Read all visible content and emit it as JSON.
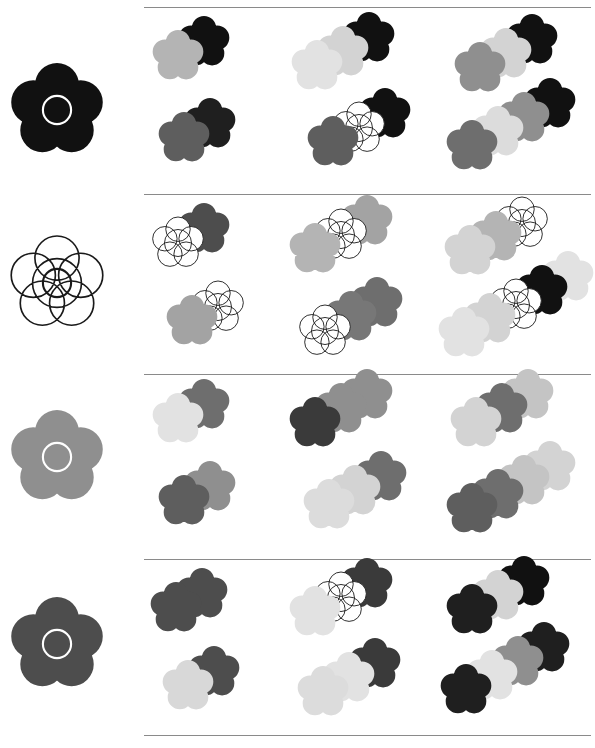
{
  "page": {
    "width": 595,
    "height": 748,
    "background": "#ffffff",
    "divider_color": "#8a8a8a",
    "divider_y": [
      7,
      194,
      374,
      559,
      735
    ],
    "divider_left": 144,
    "divider_width": 447
  },
  "legend": {
    "shape": "five-petal-flower",
    "outline_color": "#1a1a1a",
    "ring_color_on_dark": "#ffffff",
    "ring_color_on_light": "#1a1a1a",
    "grays": {
      "black": "#111111",
      "near_black": "#1f1f1f",
      "dark": "#3a3a3a",
      "dark_mid": "#4d4d4d",
      "mid_dark": "#5e5e5e",
      "mid": "#777777",
      "mid_light": "#8f8f8f",
      "light": "#aaaaaa",
      "lighter": "#c4c4c4",
      "pale": "#d8d8d8",
      "palest": "#e9e9e9",
      "white": "#ffffff"
    }
  },
  "rows": [
    {
      "id": "row-1",
      "label": "Row 1",
      "top": 8,
      "height": 186,
      "cue": {
        "label": "cue-flower-black",
        "fill": "#111111",
        "ring": "#ffffff",
        "outline": "none",
        "cx": 57,
        "cy": 102,
        "r": 47
      },
      "panels": [
        {
          "label": "Panel 1 (set size 2)",
          "left": 144,
          "width": 145,
          "clusters": [
            {
              "label": "cluster-top",
              "x": 8,
              "y": 22,
              "step_x": 26,
              "step_y": -14,
              "flower_r": 26,
              "flowers": [
                {
                  "fill": "#b4b4b4",
                  "ring": "none",
                  "outline": "none"
                },
                {
                  "fill": "#111111",
                  "ring": "none",
                  "outline": "none"
                }
              ]
            },
            {
              "label": "cluster-bottom",
              "x": 14,
              "y": 104,
              "step_x": 26,
              "step_y": -14,
              "flower_r": 26,
              "flowers": [
                {
                  "fill": "#5e5e5e",
                  "ring": "none",
                  "outline": "none"
                },
                {
                  "fill": "#1f1f1f",
                  "ring": "none",
                  "outline": "none"
                }
              ]
            }
          ]
        },
        {
          "label": "Panel 2 (set size 3)",
          "left": 289,
          "width": 155,
          "clusters": [
            {
              "label": "cluster-top",
              "x": 2,
              "y": 32,
              "step_x": 26,
              "step_y": -14,
              "flower_r": 26,
              "flowers": [
                {
                  "fill": "#e2e2e2",
                  "ring": "none",
                  "outline": "none"
                },
                {
                  "fill": "#d3d3d3",
                  "ring": "none",
                  "outline": "none"
                },
                {
                  "fill": "#111111",
                  "ring": "none",
                  "outline": "none"
                }
              ]
            },
            {
              "label": "cluster-bottom",
              "x": 18,
              "y": 108,
              "step_x": 26,
              "step_y": -14,
              "flower_r": 26,
              "flowers": [
                {
                  "fill": "#5e5e5e",
                  "ring": "none",
                  "outline": "none"
                },
                {
                  "fill": "#ffffff",
                  "ring": "none",
                  "outline": "#1a1a1a"
                },
                {
                  "fill": "#111111",
                  "ring": "none",
                  "outline": "none"
                }
              ]
            }
          ]
        },
        {
          "label": "Panel 3 (set size 4)",
          "left": 444,
          "width": 151,
          "clusters": [
            {
              "label": "cluster-top",
              "x": 10,
              "y": 34,
              "step_x": 26,
              "step_y": -14,
              "flower_r": 26,
              "flowers": [
                {
                  "fill": "#8f8f8f",
                  "ring": "none",
                  "outline": "none"
                },
                {
                  "fill": "#d3d3d3",
                  "ring": "none",
                  "outline": "none"
                },
                {
                  "fill": "#111111",
                  "ring": "none",
                  "outline": "none"
                }
              ]
            },
            {
              "label": "cluster-bottom",
              "x": 2,
              "y": 112,
              "step_x": 26,
              "step_y": -14,
              "flower_r": 26,
              "flowers": [
                {
                  "fill": "#6e6e6e",
                  "ring": "none",
                  "outline": "none"
                },
                {
                  "fill": "#dcdcdc",
                  "ring": "none",
                  "outline": "none"
                },
                {
                  "fill": "#8f8f8f",
                  "ring": "none",
                  "outline": "none"
                },
                {
                  "fill": "#111111",
                  "ring": "none",
                  "outline": "none"
                }
              ]
            }
          ]
        }
      ]
    },
    {
      "id": "row-2",
      "label": "Row 2",
      "top": 195,
      "height": 179,
      "cue": {
        "label": "cue-flower-white-outline",
        "fill": "#ffffff",
        "ring": "#1a1a1a",
        "outline": "#1a1a1a",
        "cx": 57,
        "cy": 88,
        "r": 47
      },
      "panels": [
        {
          "label": "Panel 1 (set size 2)",
          "left": 144,
          "width": 145,
          "clusters": [
            {
              "label": "cluster-top",
              "x": 8,
              "y": 22,
              "step_x": 26,
              "step_y": -14,
              "flower_r": 26,
              "flowers": [
                {
                  "fill": "#ffffff",
                  "ring": "none",
                  "outline": "#1a1a1a"
                },
                {
                  "fill": "#4d4d4d",
                  "ring": "none",
                  "outline": "none"
                }
              ]
            },
            {
              "label": "cluster-bottom",
              "x": 22,
              "y": 100,
              "step_x": 26,
              "step_y": -14,
              "flower_r": 26,
              "flowers": [
                {
                  "fill": "#a3a3a3",
                  "ring": "none",
                  "outline": "none"
                },
                {
                  "fill": "#ffffff",
                  "ring": "none",
                  "outline": "#1a1a1a"
                }
              ]
            }
          ]
        },
        {
          "label": "Panel 2 (set size 3)",
          "left": 289,
          "width": 155,
          "clusters": [
            {
              "label": "cluster-top",
              "x": 0,
              "y": 28,
              "step_x": 26,
              "step_y": -14,
              "flower_r": 26,
              "flowers": [
                {
                  "fill": "#b4b4b4",
                  "ring": "none",
                  "outline": "none"
                },
                {
                  "fill": "#ffffff",
                  "ring": "none",
                  "outline": "#1a1a1a"
                },
                {
                  "fill": "#a3a3a3",
                  "ring": "none",
                  "outline": "none"
                }
              ]
            },
            {
              "label": "cluster-bottom",
              "x": 10,
              "y": 110,
              "step_x": 26,
              "step_y": -14,
              "flower_r": 26,
              "flowers": [
                {
                  "fill": "#ffffff",
                  "ring": "none",
                  "outline": "#1a1a1a"
                },
                {
                  "fill": "#777777",
                  "ring": "none",
                  "outline": "none"
                },
                {
                  "fill": "#6e6e6e",
                  "ring": "none",
                  "outline": "none"
                }
              ]
            }
          ]
        },
        {
          "label": "Panel 3 (set size 4)",
          "left": 444,
          "width": 151,
          "clusters": [
            {
              "label": "cluster-top",
              "x": 0,
              "y": 30,
              "step_x": 26,
              "step_y": -14,
              "flower_r": 26,
              "flowers": [
                {
                  "fill": "#d3d3d3",
                  "ring": "none",
                  "outline": "none"
                },
                {
                  "fill": "#b4b4b4",
                  "ring": "none",
                  "outline": "none"
                },
                {
                  "fill": "#ffffff",
                  "ring": "none",
                  "outline": "#1a1a1a"
                }
              ]
            },
            {
              "label": "cluster-bottom",
              "x": -6,
              "y": 112,
              "step_x": 26,
              "step_y": -14,
              "flower_r": 26,
              "flowers": [
                {
                  "fill": "#e2e2e2",
                  "ring": "none",
                  "outline": "none"
                },
                {
                  "fill": "#d3d3d3",
                  "ring": "none",
                  "outline": "none"
                },
                {
                  "fill": "#ffffff",
                  "ring": "none",
                  "outline": "#1a1a1a"
                },
                {
                  "fill": "#111111",
                  "ring": "none",
                  "outline": "none"
                },
                {
                  "fill": "#e2e2e2",
                  "ring": "none",
                  "outline": "none"
                }
              ]
            }
          ]
        }
      ]
    },
    {
      "id": "row-3",
      "label": "Row 3",
      "top": 375,
      "height": 184,
      "cue": {
        "label": "cue-flower-mid-gray",
        "fill": "#8f8f8f",
        "ring": "#ffffff",
        "outline": "none",
        "cx": 57,
        "cy": 82,
        "r": 47
      },
      "panels": [
        {
          "label": "Panel 1 (set size 2)",
          "left": 144,
          "width": 145,
          "clusters": [
            {
              "label": "cluster-top",
              "x": 8,
              "y": 18,
              "step_x": 26,
              "step_y": -14,
              "flower_r": 26,
              "flowers": [
                {
                  "fill": "#e2e2e2",
                  "ring": "none",
                  "outline": "none"
                },
                {
                  "fill": "#6e6e6e",
                  "ring": "none",
                  "outline": "none"
                }
              ]
            },
            {
              "label": "cluster-bottom",
              "x": 14,
              "y": 100,
              "step_x": 26,
              "step_y": -14,
              "flower_r": 26,
              "flowers": [
                {
                  "fill": "#5e5e5e",
                  "ring": "none",
                  "outline": "none"
                },
                {
                  "fill": "#8f8f8f",
                  "ring": "none",
                  "outline": "none"
                }
              ]
            }
          ]
        },
        {
          "label": "Panel 2 (set size 3)",
          "left": 289,
          "width": 155,
          "clusters": [
            {
              "label": "cluster-top",
              "x": 0,
              "y": 22,
              "step_x": 26,
              "step_y": -14,
              "flower_r": 26,
              "flowers": [
                {
                  "fill": "#3a3a3a",
                  "ring": "none",
                  "outline": "none"
                },
                {
                  "fill": "#8f8f8f",
                  "ring": "none",
                  "outline": "none"
                },
                {
                  "fill": "#8f8f8f",
                  "ring": "none",
                  "outline": "none"
                }
              ]
            },
            {
              "label": "cluster-bottom",
              "x": 14,
              "y": 104,
              "step_x": 26,
              "step_y": -14,
              "flower_r": 26,
              "flowers": [
                {
                  "fill": "#dcdcdc",
                  "ring": "none",
                  "outline": "none"
                },
                {
                  "fill": "#d3d3d3",
                  "ring": "none",
                  "outline": "none"
                },
                {
                  "fill": "#6e6e6e",
                  "ring": "none",
                  "outline": "none"
                }
              ]
            }
          ]
        },
        {
          "label": "Panel 3 (set size 4)",
          "left": 444,
          "width": 151,
          "clusters": [
            {
              "label": "cluster-top",
              "x": 6,
              "y": 22,
              "step_x": 26,
              "step_y": -14,
              "flower_r": 26,
              "flowers": [
                {
                  "fill": "#d3d3d3",
                  "ring": "none",
                  "outline": "none"
                },
                {
                  "fill": "#6e6e6e",
                  "ring": "none",
                  "outline": "none"
                },
                {
                  "fill": "#c4c4c4",
                  "ring": "none",
                  "outline": "none"
                }
              ]
            },
            {
              "label": "cluster-bottom",
              "x": 2,
              "y": 108,
              "step_x": 26,
              "step_y": -14,
              "flower_r": 26,
              "flowers": [
                {
                  "fill": "#5e5e5e",
                  "ring": "none",
                  "outline": "none"
                },
                {
                  "fill": "#6e6e6e",
                  "ring": "none",
                  "outline": "none"
                },
                {
                  "fill": "#c4c4c4",
                  "ring": "none",
                  "outline": "none"
                },
                {
                  "fill": "#d3d3d3",
                  "ring": "none",
                  "outline": "none"
                }
              ]
            }
          ]
        }
      ]
    },
    {
      "id": "row-4",
      "label": "Row 4",
      "top": 560,
      "height": 175,
      "cue": {
        "label": "cue-flower-dark-gray",
        "fill": "#4d4d4d",
        "ring": "#ffffff",
        "outline": "none",
        "cx": 57,
        "cy": 84,
        "r": 47
      },
      "panels": [
        {
          "label": "Panel 1 (set size 2)",
          "left": 144,
          "width": 145,
          "clusters": [
            {
              "label": "cluster-top",
              "x": 6,
              "y": 22,
              "step_x": 26,
              "step_y": -14,
              "flower_r": 26,
              "flowers": [
                {
                  "fill": "#4d4d4d",
                  "ring": "none",
                  "outline": "none"
                },
                {
                  "fill": "#4d4d4d",
                  "ring": "none",
                  "outline": "none"
                }
              ]
            },
            {
              "label": "cluster-bottom",
              "x": 18,
              "y": 100,
              "step_x": 26,
              "step_y": -14,
              "flower_r": 26,
              "flowers": [
                {
                  "fill": "#d8d8d8",
                  "ring": "none",
                  "outline": "none"
                },
                {
                  "fill": "#4d4d4d",
                  "ring": "none",
                  "outline": "none"
                }
              ]
            }
          ]
        },
        {
          "label": "Panel 2 (set size 3)",
          "left": 289,
          "width": 155,
          "clusters": [
            {
              "label": "cluster-top",
              "x": 0,
              "y": 26,
              "step_x": 26,
              "step_y": -14,
              "flower_r": 26,
              "flowers": [
                {
                  "fill": "#e2e2e2",
                  "ring": "none",
                  "outline": "none"
                },
                {
                  "fill": "#ffffff",
                  "ring": "none",
                  "outline": "#1a1a1a"
                },
                {
                  "fill": "#3a3a3a",
                  "ring": "none",
                  "outline": "none"
                }
              ]
            },
            {
              "label": "cluster-bottom",
              "x": 8,
              "y": 106,
              "step_x": 26,
              "step_y": -14,
              "flower_r": 26,
              "flowers": [
                {
                  "fill": "#dcdcdc",
                  "ring": "none",
                  "outline": "none"
                },
                {
                  "fill": "#e2e2e2",
                  "ring": "none",
                  "outline": "none"
                },
                {
                  "fill": "#3a3a3a",
                  "ring": "none",
                  "outline": "none"
                }
              ]
            }
          ]
        },
        {
          "label": "Panel 3 (set size 4)",
          "left": 444,
          "width": 151,
          "clusters": [
            {
              "label": "cluster-top",
              "x": 2,
              "y": 24,
              "step_x": 26,
              "step_y": -14,
              "flower_r": 26,
              "flowers": [
                {
                  "fill": "#1f1f1f",
                  "ring": "none",
                  "outline": "none"
                },
                {
                  "fill": "#d3d3d3",
                  "ring": "none",
                  "outline": "none"
                },
                {
                  "fill": "#111111",
                  "ring": "none",
                  "outline": "none"
                }
              ]
            },
            {
              "label": "cluster-bottom",
              "x": -4,
              "y": 104,
              "step_x": 26,
              "step_y": -14,
              "flower_r": 26,
              "flowers": [
                {
                  "fill": "#1f1f1f",
                  "ring": "none",
                  "outline": "none"
                },
                {
                  "fill": "#e2e2e2",
                  "ring": "none",
                  "outline": "none"
                },
                {
                  "fill": "#8f8f8f",
                  "ring": "none",
                  "outline": "none"
                },
                {
                  "fill": "#1f1f1f",
                  "ring": "none",
                  "outline": "none"
                }
              ]
            }
          ]
        }
      ]
    }
  ]
}
